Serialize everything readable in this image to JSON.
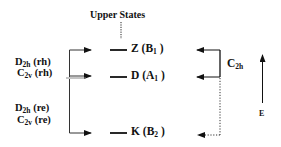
{
  "diagram": {
    "title": "Upper States",
    "levels": [
      {
        "letter": "Z",
        "symmetry": "B",
        "sub": "1"
      },
      {
        "letter": "D",
        "symmetry": "A",
        "sub": "1"
      },
      {
        "letter": "K",
        "symmetry": "B",
        "sub": "2"
      }
    ],
    "left_groups": [
      {
        "lines": [
          {
            "main": "D",
            "sub": "2h",
            "suffix": " (rh)"
          },
          {
            "main": "C",
            "sub": "2v",
            "suffix": " (rh)"
          }
        ]
      },
      {
        "lines": [
          {
            "main": "D",
            "sub": "2h",
            "suffix": " (re)"
          },
          {
            "main": "C",
            "sub": "2v",
            "suffix": " (re)"
          }
        ]
      }
    ],
    "right_label": {
      "main": "C",
      "sub": "2h"
    },
    "energy_axis": {
      "label": "E",
      "icon": "up-arrow"
    }
  }
}
